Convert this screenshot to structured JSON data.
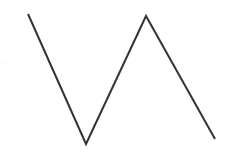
{
  "diagram": {
    "shape": "zigzag-line",
    "stroke_color": "#333333",
    "stroke_width": 2,
    "background": "#ffffff",
    "points": [
      {
        "x": 28,
        "y": 14
      },
      {
        "x": 86,
        "y": 144
      },
      {
        "x": 146,
        "y": 16
      },
      {
        "x": 215,
        "y": 139
      }
    ],
    "speck": {
      "x": 5,
      "y": 62,
      "color": "#d8d8d8"
    }
  }
}
